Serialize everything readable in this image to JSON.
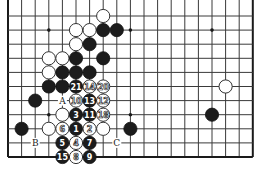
{
  "diagram": {
    "type": "go-board-diagram",
    "board": {
      "columns": 19,
      "visible_rows": 11,
      "open_top": true,
      "origin_x": 8,
      "origin_y": 16,
      "spacing_x": 13.6,
      "spacing_y": 14.1,
      "line_color": "#3a3a3a",
      "black_color": "#1c1c1c",
      "white_color": "#ffffff"
    },
    "star_points": [
      [
        3,
        1
      ],
      [
        9,
        1
      ],
      [
        15,
        1
      ],
      [
        3,
        7
      ],
      [
        9,
        7
      ]
    ],
    "white_stones": [
      [
        7,
        0
      ],
      [
        5,
        1
      ],
      [
        6,
        1
      ],
      [
        5,
        2
      ],
      [
        3,
        3
      ],
      [
        4,
        3
      ],
      [
        3,
        4
      ],
      [
        16,
        5
      ],
      [
        4,
        7
      ],
      [
        3,
        8
      ],
      [
        7,
        8
      ]
    ],
    "black_stones": [
      [
        7,
        1
      ],
      [
        8,
        1
      ],
      [
        6,
        2
      ],
      [
        5,
        3
      ],
      [
        7,
        3
      ],
      [
        4,
        4
      ],
      [
        5,
        4
      ],
      [
        6,
        4
      ],
      [
        3,
        5
      ],
      [
        4,
        5
      ],
      [
        2,
        6
      ],
      [
        15,
        7
      ],
      [
        1,
        8
      ],
      [
        9,
        8
      ]
    ],
    "numbered_moves": [
      {
        "n": "1",
        "color": "black",
        "pos": [
          5,
          8
        ]
      },
      {
        "n": "2",
        "color": "white",
        "pos": [
          6,
          8
        ]
      },
      {
        "n": "3",
        "color": "black",
        "pos": [
          5,
          7
        ]
      },
      {
        "n": "4",
        "color": "white",
        "pos": [
          5,
          9
        ]
      },
      {
        "n": "5",
        "color": "black",
        "pos": [
          4,
          9
        ]
      },
      {
        "n": "6",
        "color": "white",
        "pos": [
          4,
          8
        ]
      },
      {
        "n": "7",
        "color": "black",
        "pos": [
          6,
          9
        ]
      },
      {
        "n": "8",
        "color": "white",
        "pos": [
          5,
          10
        ]
      },
      {
        "n": "9",
        "color": "black",
        "pos": [
          6,
          10
        ]
      },
      {
        "n": "10",
        "color": "white",
        "pos": [
          5,
          6
        ]
      },
      {
        "n": "11",
        "color": "black",
        "pos": [
          6,
          7
        ]
      },
      {
        "n": "12",
        "color": "white",
        "pos": [
          7,
          6
        ]
      },
      {
        "n": "13",
        "color": "black",
        "pos": [
          6,
          6
        ]
      },
      {
        "n": "14",
        "color": "white",
        "pos": [
          6,
          5
        ]
      },
      {
        "n": "15",
        "color": "black",
        "pos": [
          4,
          10
        ]
      },
      {
        "n": "18",
        "color": "white",
        "pos": [
          7,
          7
        ]
      },
      {
        "n": "20",
        "color": "white",
        "pos": [
          7,
          5
        ]
      },
      {
        "n": "21",
        "color": "black",
        "pos": [
          5,
          5
        ]
      }
    ],
    "labels": [
      {
        "text": "A",
        "pos": [
          4,
          6
        ]
      },
      {
        "text": "B",
        "pos": [
          2,
          9
        ]
      },
      {
        "text": "C",
        "pos": [
          8,
          9
        ]
      }
    ]
  }
}
